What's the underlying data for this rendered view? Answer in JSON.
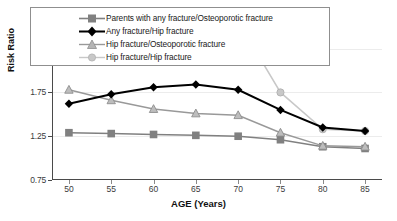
{
  "chart_data": {
    "type": "line",
    "title": "",
    "xlabel": "AGE (Years)",
    "ylabel": "Risk Ratio",
    "x": [
      50,
      55,
      60,
      65,
      70,
      75,
      80,
      85
    ],
    "xtick_labels": [
      "50",
      "55",
      "60",
      "65",
      "70",
      "75",
      "80",
      "85"
    ],
    "ytick_labels": [
      "0.75",
      "1.25",
      "1.75",
      "2.25"
    ],
    "yticks": [
      0.75,
      1.25,
      1.75,
      2.25
    ],
    "ylim": [
      0.75,
      2.6
    ],
    "xlim": [
      48,
      87
    ],
    "grid": true,
    "legend_position": "top-center-overlay",
    "series": [
      {
        "name": "Parents with any fracture/Osteoporotic fracture",
        "marker": "square",
        "color": "#808080",
        "values": [
          1.29,
          1.28,
          1.27,
          1.26,
          1.25,
          1.21,
          1.13,
          1.11
        ]
      },
      {
        "name": "Any fracture/Hip fracture",
        "marker": "diamond",
        "color": "#000000",
        "values": [
          1.62,
          1.73,
          1.81,
          1.84,
          1.78,
          1.55,
          1.35,
          1.31
        ]
      },
      {
        "name": "Hip fracture/Osteoporotic fracture",
        "marker": "triangle",
        "color": "#999999",
        "values": [
          1.78,
          1.66,
          1.56,
          1.51,
          1.49,
          1.29,
          1.14,
          1.13
        ]
      },
      {
        "name": "Hip fracture/Hip fracture",
        "marker": "circle",
        "color": "#c8c8c8",
        "values": [
          2.31,
          2.33,
          2.38,
          2.42,
          2.56,
          1.75,
          1.33,
          1.31
        ]
      }
    ]
  },
  "legend": {
    "items": [
      {
        "label": "Parents with any fracture/Osteoporotic fracture"
      },
      {
        "label": "Any fracture/Hip fracture"
      },
      {
        "label": "Hip fracture/Osteoporotic fracture"
      },
      {
        "label": "Hip fracture/Hip fracture"
      }
    ]
  },
  "axes": {
    "y_title": "Risk Ratio",
    "x_title": "AGE (Years)"
  }
}
